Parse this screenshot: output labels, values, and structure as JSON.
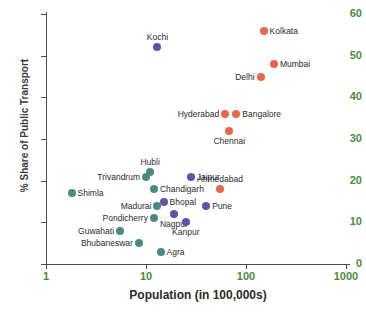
{
  "chart_data": {
    "type": "scatter",
    "title": "",
    "xlabel": "Population (in 100,000s)",
    "ylabel": "% Share of Public Transport",
    "x_scale": "log",
    "xlim": [
      1,
      1000
    ],
    "ylim": [
      0,
      60
    ],
    "xticks": [
      "1",
      "10",
      "100",
      "1000"
    ],
    "yticks": [
      "0",
      "10",
      "20",
      "30",
      "40",
      "50",
      "60"
    ],
    "grid": false,
    "legend": "none",
    "colors": {
      "orange": "#e8674a",
      "purple": "#5f52a8",
      "teal": "#4a8a80",
      "axis_label": "#4b8b3b",
      "axis_line": "#4a4a4a",
      "point_label": "#2b2b2b"
    },
    "points": [
      {
        "label": "Kochi",
        "x": 13,
        "y": 52,
        "color": "purple",
        "label_pos": "above"
      },
      {
        "label": "Kolkata",
        "x": 150,
        "y": 56,
        "color": "orange",
        "label_pos": "right"
      },
      {
        "label": "Mumbai",
        "x": 190,
        "y": 48,
        "color": "orange",
        "label_pos": "right"
      },
      {
        "label": "Delhi",
        "x": 140,
        "y": 45,
        "color": "orange",
        "label_pos": "left"
      },
      {
        "label": "Hyderabad",
        "x": 62,
        "y": 36,
        "color": "orange",
        "label_pos": "left"
      },
      {
        "label": "Bangalore",
        "x": 80,
        "y": 36,
        "color": "orange",
        "label_pos": "right"
      },
      {
        "label": "Chennai",
        "x": 68,
        "y": 32,
        "color": "orange",
        "label_pos": "below"
      },
      {
        "label": "Hubli",
        "x": 11,
        "y": 22,
        "color": "teal",
        "label_pos": "above"
      },
      {
        "label": "Trivandrum",
        "x": 10,
        "y": 21,
        "color": "teal",
        "label_pos": "left"
      },
      {
        "label": "Jaipur",
        "x": 28,
        "y": 21,
        "color": "purple",
        "label_pos": "right"
      },
      {
        "label": "Shimla",
        "x": 1.8,
        "y": 17,
        "color": "teal",
        "label_pos": "right"
      },
      {
        "label": "Chandigarh",
        "x": 12,
        "y": 18,
        "color": "teal",
        "label_pos": "right"
      },
      {
        "label": "Ahmedabad",
        "x": 55,
        "y": 18,
        "color": "orange",
        "label_pos": "above"
      },
      {
        "label": "Bhopal",
        "x": 15,
        "y": 15,
        "color": "purple",
        "label_pos": "right"
      },
      {
        "label": "Madurai",
        "x": 13,
        "y": 14,
        "color": "teal",
        "label_pos": "left"
      },
      {
        "label": "Pune",
        "x": 40,
        "y": 14,
        "color": "purple",
        "label_pos": "right"
      },
      {
        "label": "Nagpur",
        "x": 19,
        "y": 12,
        "color": "purple",
        "label_pos": "below"
      },
      {
        "label": "Pondicherry",
        "x": 12,
        "y": 11,
        "color": "teal",
        "label_pos": "left"
      },
      {
        "label": "Kanpur",
        "x": 25,
        "y": 10,
        "color": "purple",
        "label_pos": "below"
      },
      {
        "label": "Guwahati",
        "x": 5.5,
        "y": 8,
        "color": "teal",
        "label_pos": "left"
      },
      {
        "label": "Bhubaneswar",
        "x": 8.5,
        "y": 5,
        "color": "teal",
        "label_pos": "left"
      },
      {
        "label": "Agra",
        "x": 14,
        "y": 3,
        "color": "teal",
        "label_pos": "right"
      }
    ]
  }
}
